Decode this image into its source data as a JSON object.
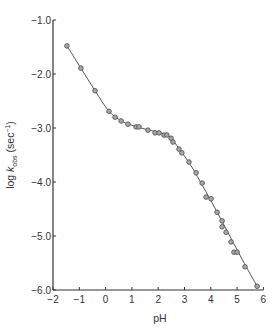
{
  "chart_data": {
    "type": "scatter",
    "title": "",
    "xlabel": "pH",
    "ylabel": "log k_obs (sec^-1)",
    "ylabel_parts": {
      "prefix": "log ",
      "k": "k",
      "sub": "obs",
      "unit_open": " (sec",
      "sup": "−1",
      "unit_close": ")"
    },
    "xlim": [
      -2,
      6
    ],
    "ylim": [
      -6.0,
      -1.0
    ],
    "x_ticks": [
      -2,
      -1,
      0,
      1,
      2,
      3,
      4,
      5,
      6
    ],
    "x_tick_labels": [
      "−2",
      "−1",
      "0",
      "1",
      "2",
      "3",
      "4",
      "5",
      "6"
    ],
    "y_ticks": [
      -1.0,
      -2.0,
      -3.0,
      -4.0,
      -5.0,
      -6.0
    ],
    "y_tick_labels": [
      "−1.0",
      "−2.0",
      "−3.0",
      "−4.0",
      "−5.0",
      "−6.0"
    ],
    "grid": false,
    "legend": null,
    "series": [
      {
        "name": "k_obs",
        "marker": "circle",
        "fit_line": true,
        "color": "#555555",
        "marker_fill": "#a8a8a8",
        "x": [
          -1.47,
          -0.94,
          -0.4,
          0.13,
          0.36,
          0.59,
          0.85,
          1.16,
          1.27,
          1.61,
          1.88,
          2.03,
          2.22,
          2.33,
          2.49,
          2.56,
          2.79,
          2.9,
          3.17,
          3.44,
          3.67,
          3.82,
          4.01,
          4.24,
          4.43,
          4.43,
          4.58,
          4.77,
          4.88,
          5.0,
          5.3,
          5.76
        ],
        "y": [
          -1.48,
          -1.89,
          -2.31,
          -2.69,
          -2.8,
          -2.87,
          -2.93,
          -2.98,
          -2.98,
          -3.04,
          -3.09,
          -3.09,
          -3.13,
          -3.13,
          -3.19,
          -3.26,
          -3.39,
          -3.46,
          -3.63,
          -3.83,
          -4.02,
          -4.28,
          -4.31,
          -4.56,
          -4.72,
          -4.83,
          -4.93,
          -5.11,
          -5.3,
          -5.3,
          -5.57,
          -5.93
        ]
      }
    ],
    "fit_curve": {
      "x": [
        -1.47,
        -0.94,
        -0.4,
        0.13,
        0.6,
        1.0,
        1.5,
        2.0,
        2.4,
        2.7,
        3.0,
        3.3,
        3.7,
        4.2,
        4.7,
        5.2,
        5.76
      ],
      "y": [
        -1.48,
        -1.89,
        -2.31,
        -2.69,
        -2.87,
        -2.95,
        -3.02,
        -3.08,
        -3.15,
        -3.32,
        -3.52,
        -3.74,
        -4.08,
        -4.52,
        -4.98,
        -5.44,
        -5.93
      ]
    }
  }
}
